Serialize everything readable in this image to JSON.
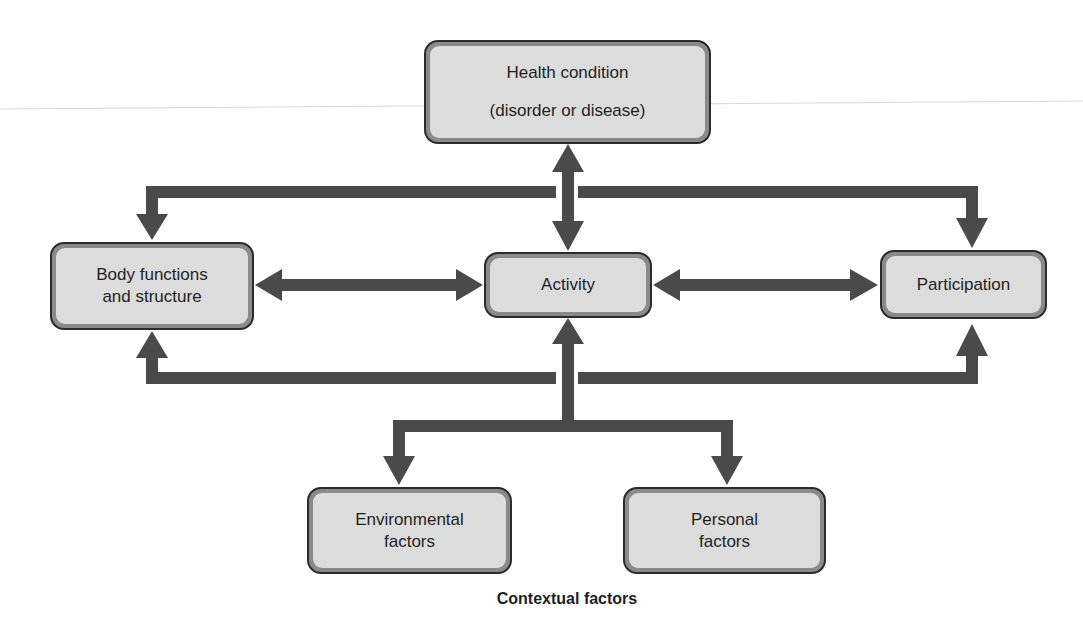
{
  "colors": {
    "arrow": "#4a4a4a",
    "box_border": "#2b2b2b",
    "box_bevel": "#8a8a8a",
    "box_fill": "#dcdcdc",
    "text": "#1f1f1f"
  },
  "nodes": {
    "health": {
      "lines": [
        "Health condition",
        "(disorder or disease)"
      ]
    },
    "body": {
      "lines": [
        "Body functions",
        "and structure"
      ]
    },
    "activity": {
      "lines": [
        "Activity"
      ]
    },
    "participation": {
      "lines": [
        "Participation"
      ]
    },
    "environmental": {
      "lines": [
        "Environmental",
        "factors"
      ]
    },
    "personal": {
      "lines": [
        "Personal",
        "factors"
      ]
    }
  },
  "caption": "Contextual factors",
  "edges": [
    {
      "from": "health",
      "to": "activity",
      "type": "bidirectional"
    },
    {
      "from": "health",
      "to": "body",
      "type": "directed"
    },
    {
      "from": "health",
      "to": "participation",
      "type": "directed"
    },
    {
      "from": "body",
      "to": "activity",
      "type": "bidirectional"
    },
    {
      "from": "activity",
      "to": "participation",
      "type": "bidirectional"
    },
    {
      "from": "contextual",
      "to": "activity",
      "type": "directed"
    },
    {
      "from": "contextual",
      "to": "body",
      "type": "directed"
    },
    {
      "from": "contextual",
      "to": "participation",
      "type": "directed"
    },
    {
      "from": "activity",
      "to": "environmental",
      "type": "directed"
    },
    {
      "from": "activity",
      "to": "personal",
      "type": "directed"
    }
  ]
}
